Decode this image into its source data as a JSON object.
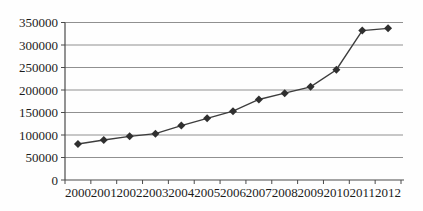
{
  "chart_data": {
    "type": "line",
    "title": "",
    "xlabel": "",
    "ylabel": "",
    "categories": [
      "2000",
      "2001",
      "2002",
      "2003",
      "2004",
      "2005",
      "2006",
      "2007",
      "2008",
      "2009",
      "2010",
      "2011",
      "2012"
    ],
    "series": [
      {
        "name": "value-by-year",
        "values": [
          80000,
          89000,
          97000,
          103000,
          121000,
          137000,
          153000,
          179000,
          193000,
          207000,
          245000,
          332000,
          337000
        ]
      }
    ],
    "ylim": [
      0,
      350000
    ],
    "ytick_step": 50000,
    "ytick_labels": [
      "0",
      "50000",
      "100000",
      "150000",
      "200000",
      "250000",
      "300000",
      "350000"
    ],
    "grid": "horizontal",
    "legend": "none",
    "marker": "diamond",
    "colors": {
      "line": "#3d3d3d",
      "marker": "#2f2f2f",
      "gridline": "#909090",
      "axis": "#4a4a4a",
      "text": "#1c1c1c",
      "background": "#fefefe"
    }
  }
}
